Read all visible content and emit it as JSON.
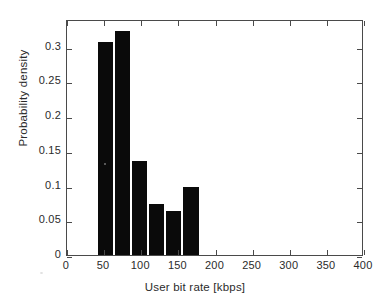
{
  "chart_data": {
    "type": "bar",
    "title": "",
    "xlabel": "User bit rate [kbps]",
    "ylabel": "Probability density",
    "xlim": [
      0,
      400
    ],
    "ylim": [
      0,
      0.34
    ],
    "grid": false,
    "legend": null,
    "bar_color": "#0a0a0a",
    "axis_color": "#4a4a4a",
    "bin_edges": [
      40,
      63,
      86,
      109,
      132,
      155,
      180
    ],
    "categories": [
      "40-63",
      "63-86",
      "86-109",
      "109-132",
      "132-155",
      "155-180"
    ],
    "bin_centers": [
      51.5,
      74.5,
      97.5,
      120.5,
      143.5,
      167.5
    ],
    "values": [
      0.307,
      0.323,
      0.136,
      0.074,
      0.064,
      0.098
    ],
    "xticks": [
      0,
      50,
      100,
      150,
      200,
      250,
      300,
      350,
      400
    ],
    "xticklabels": [
      "0",
      "50",
      "100",
      "150",
      "200",
      "250",
      "300",
      "350",
      "400"
    ],
    "yticks": [
      0,
      0.05,
      0.1,
      0.15,
      0.2,
      0.25,
      0.3
    ],
    "yticklabels": [
      "0",
      "0.05",
      "0.1",
      "0.15",
      "0.2",
      "0.25",
      "0.3"
    ]
  }
}
